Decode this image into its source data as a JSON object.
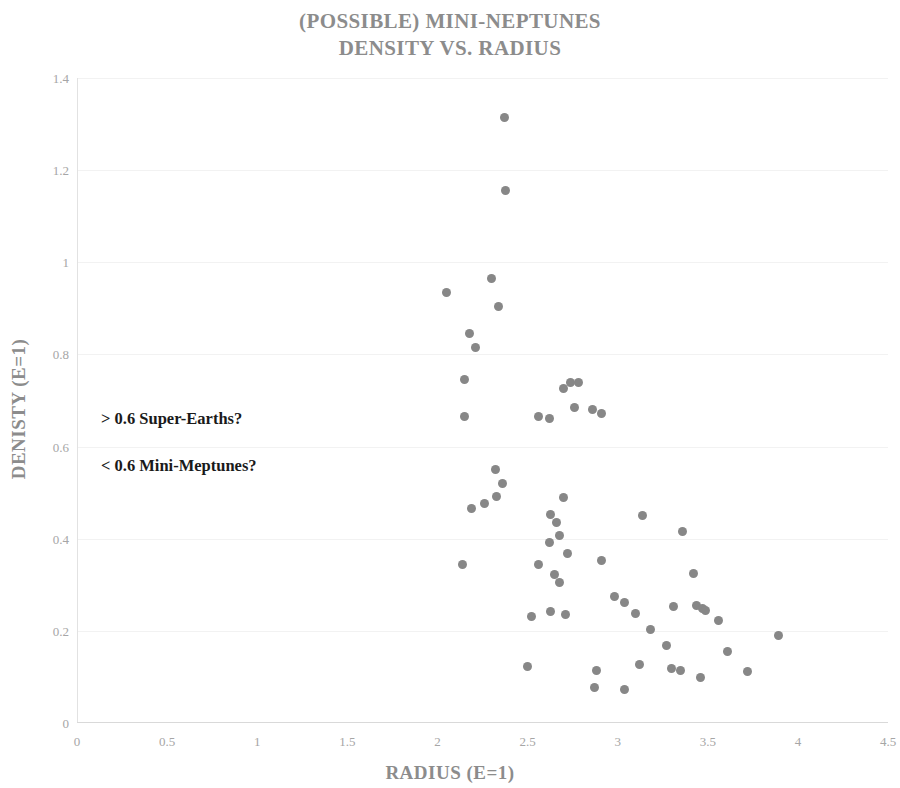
{
  "chart_data": {
    "type": "scatter",
    "title": "(POSSIBLE) MINI-NEPTUNES DENSITY VS. RADIUS",
    "title_lines": [
      "(POSSIBLE) MINI-NEPTUNES",
      "DENSITY VS. RADIUS"
    ],
    "xlabel": "RADIUS (E=1)",
    "ylabel": "DENISTY (E=1)",
    "xlim": [
      0,
      4.5
    ],
    "ylim": [
      0,
      1.4
    ],
    "xticks": [
      "0",
      "0.5",
      "1",
      "1.5",
      "2",
      "2.5",
      "3",
      "3.5",
      "4",
      "4.5"
    ],
    "xtick_values": [
      0,
      0.5,
      1,
      1.5,
      2,
      2.5,
      3,
      3.5,
      4,
      4.5
    ],
    "yticks": [
      "0",
      "0.2",
      "0.4",
      "0.6",
      "0.8",
      "1",
      "1.2",
      "1.4"
    ],
    "ytick_values": [
      0,
      0.2,
      0.4,
      0.6,
      0.8,
      1,
      1.2,
      1.4
    ],
    "grid": "horizontal",
    "legend": null,
    "marker_color": "#878787",
    "title_color": "#8c8c8c",
    "axis_label_color": "#8c8c8c",
    "tick_color": "#a6a6a6",
    "series": [
      {
        "name": "Mini-Neptunes",
        "points": [
          [
            2.37,
            1.315
          ],
          [
            2.38,
            1.155
          ],
          [
            2.05,
            0.935
          ],
          [
            2.3,
            0.965
          ],
          [
            2.34,
            0.905
          ],
          [
            2.18,
            0.845
          ],
          [
            2.21,
            0.815
          ],
          [
            2.15,
            0.745
          ],
          [
            2.74,
            0.74
          ],
          [
            2.78,
            0.74
          ],
          [
            2.7,
            0.725
          ],
          [
            2.76,
            0.685
          ],
          [
            2.15,
            0.665
          ],
          [
            2.56,
            0.665
          ],
          [
            2.62,
            0.662
          ],
          [
            2.86,
            0.68
          ],
          [
            2.91,
            0.672
          ],
          [
            2.32,
            0.55
          ],
          [
            2.36,
            0.52
          ],
          [
            2.33,
            0.492
          ],
          [
            2.7,
            0.49
          ],
          [
            2.19,
            0.465
          ],
          [
            2.26,
            0.477
          ],
          [
            2.63,
            0.452
          ],
          [
            2.66,
            0.435
          ],
          [
            3.14,
            0.45
          ],
          [
            2.68,
            0.408
          ],
          [
            3.36,
            0.415
          ],
          [
            2.62,
            0.392
          ],
          [
            2.72,
            0.368
          ],
          [
            2.56,
            0.345
          ],
          [
            2.14,
            0.345
          ],
          [
            2.91,
            0.352
          ],
          [
            2.65,
            0.322
          ],
          [
            2.68,
            0.305
          ],
          [
            3.42,
            0.325
          ],
          [
            2.98,
            0.275
          ],
          [
            3.04,
            0.262
          ],
          [
            2.63,
            0.242
          ],
          [
            2.71,
            0.235
          ],
          [
            3.31,
            0.252
          ],
          [
            3.44,
            0.255
          ],
          [
            3.47,
            0.248
          ],
          [
            3.49,
            0.245
          ],
          [
            3.1,
            0.238
          ],
          [
            2.52,
            0.232
          ],
          [
            3.56,
            0.222
          ],
          [
            3.89,
            0.19
          ],
          [
            3.18,
            0.202
          ],
          [
            3.61,
            0.155
          ],
          [
            3.27,
            0.168
          ],
          [
            3.72,
            0.112
          ],
          [
            3.3,
            0.118
          ],
          [
            3.35,
            0.115
          ],
          [
            3.46,
            0.098
          ],
          [
            3.12,
            0.128
          ],
          [
            2.88,
            0.115
          ],
          [
            2.5,
            0.122
          ],
          [
            2.87,
            0.078
          ],
          [
            3.04,
            0.072
          ]
        ]
      }
    ],
    "annotations": [
      {
        "id": "super-earths",
        "text": "> 0.6 Super-Earths?",
        "x": 0.75,
        "y": 0.655
      },
      {
        "id": "mini-neptunes",
        "text": "< 0.6 Mini-Meptunes?",
        "x": 0.75,
        "y": 0.555
      }
    ]
  }
}
